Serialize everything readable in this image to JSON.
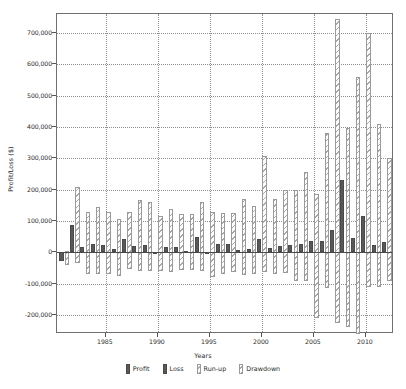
{
  "chart_data": {
    "type": "bar",
    "title": "",
    "xlabel": "Years",
    "ylabel": "Profit/Loss ($)",
    "grid": true,
    "legend_position": "bottom",
    "ylim": [
      -260000,
      760000
    ],
    "xlim": [
      1980.3,
      2012.7
    ],
    "ytick_labels": [
      "700,000",
      "600,000",
      "500,000",
      "400,000",
      "300,000",
      "200,000",
      "100,000",
      "0",
      "-100,000",
      "-200,000"
    ],
    "ytick_values": [
      700000,
      600000,
      500000,
      400000,
      300000,
      200000,
      100000,
      0,
      -100000,
      -200000
    ],
    "xtick_labels": [
      "1985",
      "1990",
      "1995",
      "2000",
      "2005",
      "2010"
    ],
    "xtick_values": [
      1985,
      1990,
      1995,
      2000,
      2005,
      2010
    ],
    "categories": [
      1981,
      1982,
      1983,
      1984,
      1985,
      1986,
      1987,
      1988,
      1989,
      1990,
      1991,
      1992,
      1993,
      1994,
      1995,
      1996,
      1997,
      1998,
      1999,
      2000,
      2001,
      2002,
      2003,
      2004,
      2005,
      2006,
      2007,
      2008,
      2009,
      2010,
      2011,
      2012
    ],
    "series": [
      {
        "name": "Profit",
        "swatch": "solid",
        "color": "#585858",
        "values": [
          0,
          88000,
          16000,
          26000,
          25000,
          12000,
          42000,
          20000,
          24000,
          0,
          18000,
          17000,
          5000,
          48000,
          0,
          26000,
          26000,
          7000,
          10000,
          43000,
          15000,
          19000,
          24000,
          28000,
          37000,
          35000,
          71000,
          232000,
          47000,
          115000,
          24000,
          32000
        ]
      },
      {
        "name": "Loss",
        "swatch": "solid",
        "color": "#585858",
        "values": [
          -27000,
          0,
          0,
          0,
          0,
          0,
          0,
          0,
          0,
          -6000,
          0,
          0,
          0,
          0,
          -4000,
          0,
          0,
          0,
          0,
          0,
          0,
          0,
          0,
          0,
          0,
          0,
          0,
          0,
          0,
          0,
          0,
          0
        ]
      },
      {
        "name": "Run-up",
        "swatch": "hatch",
        "color": "#a9a9a9",
        "values": [
          6000,
          208000,
          128000,
          146000,
          128000,
          107000,
          130000,
          166000,
          160000,
          116000,
          140000,
          124000,
          124000,
          160000,
          128000,
          127000,
          127000,
          170000,
          148000,
          308000,
          170000,
          200000,
          200000,
          256000,
          185000,
          380000,
          745000,
          396000,
          560000,
          700000,
          410000,
          300000
        ]
      },
      {
        "name": "Drawdown",
        "swatch": "hatch",
        "color": "#a9a9a9",
        "values": [
          -40000,
          -35000,
          -70000,
          -70000,
          -68000,
          -75000,
          -52000,
          -60000,
          -60000,
          -60000,
          -62000,
          -55000,
          -55000,
          -60000,
          -78000,
          -70000,
          -63000,
          -72000,
          -68000,
          -63000,
          -70000,
          -65000,
          -92000,
          -92000,
          -210000,
          -115000,
          -225000,
          -237000,
          -260000,
          -110000,
          -110000,
          -92000
        ]
      }
    ],
    "legend": [
      {
        "label": "Profit",
        "swatch": "solid"
      },
      {
        "label": "Loss",
        "swatch": "solid"
      },
      {
        "label": "Run-up",
        "swatch": "hatch"
      },
      {
        "label": "Drawdown",
        "swatch": "hatch"
      }
    ]
  }
}
